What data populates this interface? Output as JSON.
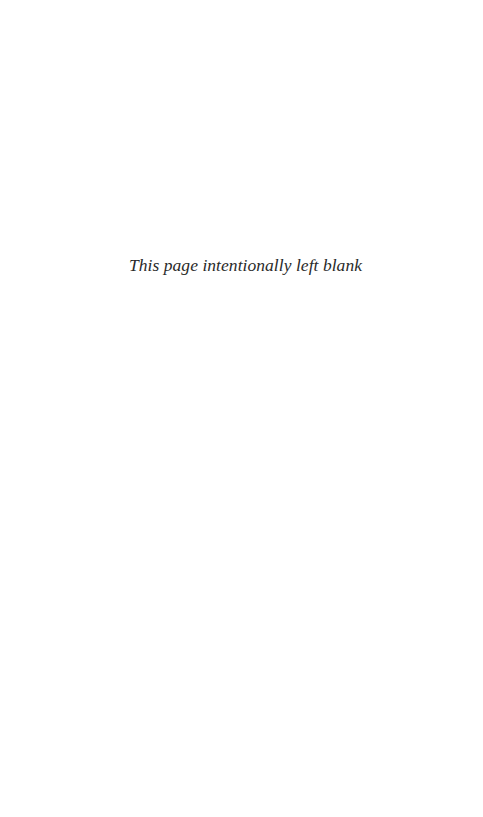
{
  "page": {
    "notice": "This page intentionally left blank",
    "background_color": "#ffffff",
    "text_color": "#2a2a2a"
  }
}
